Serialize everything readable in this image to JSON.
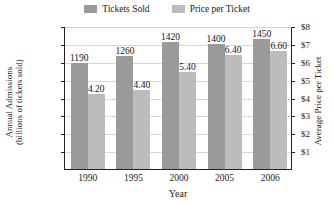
{
  "chart_data": {
    "type": "bar",
    "title": "",
    "categories": [
      "1990",
      "1995",
      "2000",
      "2005",
      "2006"
    ],
    "series": [
      {
        "name": "Tickets Sold",
        "axis": "left",
        "color": "#9a9a9a",
        "values": [
          1190,
          1260,
          1420,
          1400,
          1450
        ],
        "labels": [
          "1190",
          "1260",
          "1420",
          "1400",
          "1450"
        ]
      },
      {
        "name": "Price per Ticket",
        "axis": "right",
        "color": "#bcbcbc",
        "values": [
          4.2,
          4.4,
          5.4,
          6.4,
          6.6
        ],
        "labels": [
          "4.20",
          "4.40",
          "5.40",
          "6.40",
          "6.60"
        ]
      }
    ],
    "xlabel": "Year",
    "ylabel": "Annual Admissions (billions of tickets sold)",
    "ylabel_line1": "Annual Admissions",
    "ylabel_line2": "(billions of tickets sold)",
    "y2label": "Average Price per Ticket",
    "ylim": [
      0,
      1600
    ],
    "y2lim": [
      0,
      8
    ],
    "yticks": [
      1600,
      1400,
      1200,
      1000,
      800,
      600,
      400,
      200
    ],
    "ytick_labels": [
      "1600",
      "1400",
      "1200",
      "1000",
      "800",
      "600",
      "400",
      "200"
    ],
    "y2ticks": [
      8,
      7,
      6,
      5,
      4,
      3,
      2,
      1
    ],
    "y2tick_labels": [
      "$8",
      "$7",
      "$6",
      "$5",
      "$4",
      "$3",
      "$2",
      "$1"
    ],
    "grid": true,
    "legend_position": "top-center"
  },
  "legend": {
    "items": [
      {
        "label": "Tickets Sold",
        "color": "#9a9a9a"
      },
      {
        "label": "Price per Ticket",
        "color": "#bcbcbc"
      }
    ]
  }
}
